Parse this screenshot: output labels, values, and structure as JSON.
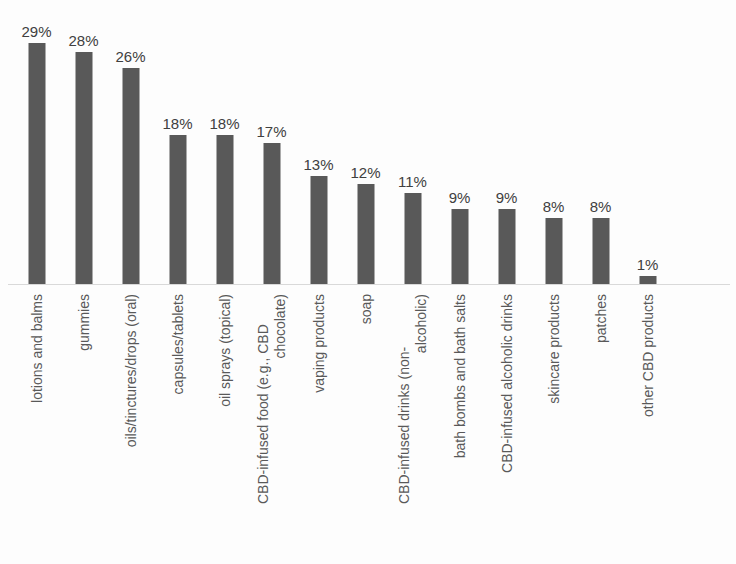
{
  "chart_data": {
    "type": "bar",
    "title": "",
    "subtitle": "",
    "xlabel": "",
    "ylabel": "",
    "ylim": [
      0,
      29
    ],
    "grid": false,
    "legend": false,
    "orientation": "vertical",
    "value_suffix": "%",
    "categories": [
      "lotions and balms",
      "gummies",
      "oils/tinctures/drops (oral)",
      "capsules/tablets",
      "oil sprays (topical)",
      "CBD-infused food (e.g., CBD chocolate)",
      "vaping products",
      "soap",
      "CBD-infused drinks (non-alcoholic)",
      "bath bombs and bath salts",
      "CBD-infused alcoholic drinks",
      "skincare products",
      "patches",
      "other CBD products"
    ],
    "values": [
      29,
      28,
      26,
      18,
      18,
      17,
      13,
      12,
      11,
      9,
      9,
      8,
      8,
      1
    ],
    "data_labels": [
      "29%",
      "28%",
      "26%",
      "18%",
      "18%",
      "17%",
      "13%",
      "12%",
      "11%",
      "9%",
      "9%",
      "8%",
      "8%",
      "1%"
    ],
    "category_label_lines": [
      [
        "lotions and balms"
      ],
      [
        "gummies"
      ],
      [
        "oils/tinctures/drops (oral)"
      ],
      [
        "capsules/tablets"
      ],
      [
        "oil sprays (topical)"
      ],
      [
        "CBD-infused food (e.g., CBD",
        "chocolate)"
      ],
      [
        "vaping products"
      ],
      [
        "soap"
      ],
      [
        "CBD-infused drinks (non-",
        "alcoholic)"
      ],
      [
        "bath bombs and bath salts"
      ],
      [
        "CBD-infused alcoholic drinks"
      ],
      [
        "skincare products"
      ],
      [
        "patches"
      ],
      [
        "other CBD products"
      ]
    ]
  },
  "style": {
    "bar_color": "#595959",
    "data_label_color": "#404040",
    "category_label_color": "#595959",
    "axis_line_color": "#d9d9d9",
    "background_color": "#fdfdfd"
  }
}
